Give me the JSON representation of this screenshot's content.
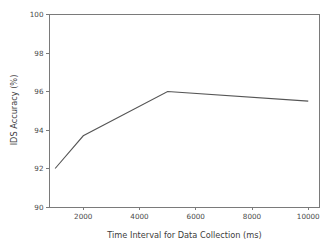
{
  "chart_data": {
    "type": "line",
    "title": "",
    "xlabel": "Time Interval for Data Collection (ms)",
    "ylabel": "IDS Accuracy (%)",
    "x": [
      1000,
      2000,
      5000,
      10000
    ],
    "values": [
      92.0,
      93.7,
      96.0,
      95.5
    ],
    "series": [
      {
        "name": "IDS Accuracy",
        "x": [
          1000,
          2000,
          5000,
          10000
        ],
        "values": [
          92.0,
          93.7,
          96.0,
          95.5
        ],
        "color": "#555555",
        "marker": "none",
        "linewidth": 1.1
      }
    ],
    "xlim": [
      800,
      10400
    ],
    "ylim": [
      90,
      100
    ],
    "xticks": [
      2000,
      4000,
      6000,
      8000,
      10000
    ],
    "xticklabels": [
      "2000",
      "4000",
      "6000",
      "8000",
      "10000"
    ],
    "yticks": [
      90,
      92,
      94,
      96,
      98,
      100
    ],
    "yticklabels": [
      "90",
      "92",
      "94",
      "96",
      "98",
      "100"
    ],
    "grid": false,
    "legend": false,
    "legend_position": "none",
    "annotations": []
  },
  "axes": {
    "frame_color": "#7a7a7a",
    "tick_color": "#7a7a7a",
    "tick_label_color": "#4a4a4a",
    "axis_label_color": "#3d3d3d",
    "background": "#ffffff"
  }
}
